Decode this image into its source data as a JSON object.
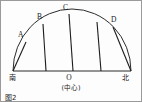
{
  "figure": {
    "caption": "图2",
    "title": "",
    "points": [
      {
        "id": "A",
        "label": "A",
        "label_x": 17,
        "label_y": 36,
        "arc_x": 25,
        "arc_y": 41,
        "base_x": 12,
        "base_y": 70
      },
      {
        "id": "B",
        "label": "B",
        "label_x": 36,
        "label_y": 18,
        "arc_x": 42,
        "arc_y": 23,
        "base_x": 45,
        "base_y": 70
      },
      {
        "id": "C",
        "label": "C",
        "label_x": 62,
        "label_y": 9,
        "arc_x": 68,
        "arc_y": 13,
        "base_x": 72,
        "base_y": 70
      },
      {
        "id": "D",
        "label": "D",
        "label_x": 110,
        "label_y": 21,
        "arc_x": 112,
        "arc_y": 26,
        "base_x": 100,
        "base_y": 70
      }
    ],
    "directions": {
      "south": "南",
      "north": "北"
    },
    "center": {
      "marker": "O",
      "note": "(中心)"
    },
    "geometry": {
      "base_left_x": 12,
      "base_right_x": 130,
      "base_y": 70,
      "apex_x": 71,
      "apex_y": 8
    },
    "colors": {
      "stroke": "#2b2b2b",
      "path_stroke": "#1c1c1c",
      "text": "#1a1a1a",
      "background": "#fdfdfd",
      "border": "#9a9a9a"
    }
  }
}
